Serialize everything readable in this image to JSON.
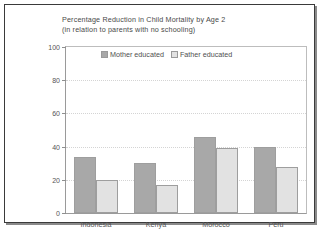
{
  "figure": {
    "title_line1": "Percentage Reduction in Child Mortality by Age 2",
    "title_line2": "(in relation to parents with no schooling)"
  },
  "legend": {
    "items": [
      {
        "label": "Mother educated",
        "color": "#a8a8a8",
        "swatch_icon": "legend-swatch-icon"
      },
      {
        "label": "Father educated",
        "color": "#e2e2e2",
        "swatch_icon": "legend-swatch-icon"
      }
    ]
  },
  "axes": {
    "y_ticks": [
      "100",
      "80",
      "60",
      "40",
      "20",
      "0"
    ],
    "x_categories": [
      "Indonesia",
      "Kenya",
      "Morocco",
      "Peru"
    ]
  },
  "chart_data": {
    "type": "bar",
    "title": "Percentage Reduction in Child Mortality by Age 2 (in relation to parents with no schooling)",
    "xlabel": "",
    "ylabel": "",
    "ylim": [
      0,
      100
    ],
    "yticks": [
      0,
      20,
      40,
      60,
      80,
      100
    ],
    "grid": true,
    "legend_position": "top-center-inside",
    "categories": [
      "Indonesia",
      "Kenya",
      "Morocco",
      "Peru"
    ],
    "series": [
      {
        "name": "Mother educated",
        "color": "#a8a8a8",
        "values": [
          34,
          30,
          46,
          40
        ]
      },
      {
        "name": "Father educated",
        "color": "#e2e2e2",
        "values": [
          20,
          17,
          39,
          28
        ]
      }
    ]
  }
}
